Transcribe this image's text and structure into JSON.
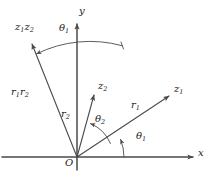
{
  "figure": {
    "type": "complex-plane-polar-multiplication-diagram",
    "background": "#ffffff",
    "stroke_color": "#4a4a4a",
    "text_color": "#1a1a1a"
  },
  "axes": {
    "x_label": "x",
    "y_label": "y",
    "origin_label": "O",
    "origin_px": {
      "x": 77,
      "y": 157
    },
    "x_axis_from_px": {
      "x": 2,
      "y": 157
    },
    "x_axis_to_px": {
      "x": 196,
      "y": 157
    },
    "y_axis_from_px": {
      "x": 77,
      "y": 170
    },
    "y_axis_to_px": {
      "x": 77,
      "y": 20
    }
  },
  "vectors": [
    {
      "name": "z1",
      "tip_label": "z",
      "tip_sub": "1",
      "magnitude_label": "r",
      "magnitude_sub": "1",
      "angle_label": "θ",
      "angle_sub": "1",
      "angle_deg": 22,
      "tip_px": {
        "x": 173,
        "y": 94
      }
    },
    {
      "name": "z2",
      "tip_label": "z",
      "tip_sub": "2",
      "magnitude_label": "r",
      "magnitude_sub": "2",
      "angle_label": "θ",
      "angle_sub": "2",
      "angle_deg": 68,
      "tip_px": {
        "x": 96,
        "y": 91
      }
    },
    {
      "name": "z1z2",
      "tip_label": "z₁z₂",
      "magnitude_label": "r₁r₂",
      "angle_label": "θ₁",
      "angle_deg": 112,
      "tip_px": {
        "x": 29,
        "y": 40
      }
    }
  ],
  "labels": {
    "y_axis": {
      "text": "y",
      "x": 79,
      "y": 12
    },
    "x_axis": {
      "text": "x",
      "x": 198,
      "y": 151
    },
    "origin": {
      "text": "O",
      "x": 66,
      "y": 160
    },
    "z1_tip": {
      "base": "z",
      "sub": "1",
      "x": 174,
      "y": 88
    },
    "z2_tip": {
      "base": "z",
      "sub": "2",
      "x": 98,
      "y": 85
    },
    "z1z2_tip": {
      "base": "z",
      "sub": "1",
      "base2": "z",
      "sub2": "2",
      "x": 17,
      "y": 27
    },
    "r1": {
      "base": "r",
      "sub": "1",
      "x": 132,
      "y": 105
    },
    "r2": {
      "base": "r",
      "sub": "2",
      "x": 63,
      "y": 114
    },
    "r1r2": {
      "base": "r",
      "sub": "1",
      "base2": "r",
      "sub2": "2",
      "x": 13,
      "y": 92
    },
    "theta1_lower": {
      "base": "θ",
      "sub": "1",
      "x": 137,
      "y": 136
    },
    "theta2": {
      "base": "θ",
      "sub": "2",
      "x": 96,
      "y": 119
    },
    "theta1_upper": {
      "base": "θ",
      "sub": "1",
      "x": 60,
      "y": 28
    }
  },
  "arcs": [
    {
      "name": "theta1-lower-arc",
      "radius": 47,
      "from_deg": 0,
      "to_deg": 22,
      "arrow_at": "end"
    },
    {
      "name": "theta2-arc",
      "radius": 36,
      "from_deg": 22,
      "to_deg": 68,
      "arrow_at": "end"
    },
    {
      "name": "theta1-upper-arc",
      "radius": 120,
      "from_deg": 68,
      "to_deg": 112,
      "arrow_at": "end"
    }
  ]
}
